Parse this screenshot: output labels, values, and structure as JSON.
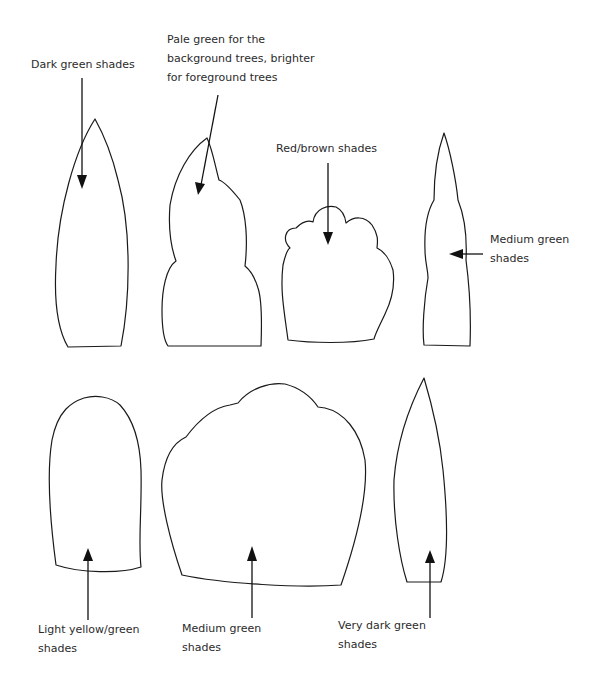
{
  "diagram": {
    "type": "tree-shape-color-guide",
    "labels": [
      {
        "id": "dark-green",
        "text": "Dark green shades"
      },
      {
        "id": "pale-green",
        "text": "Pale green for the\nbackground trees, brighter\nfor foreground trees"
      },
      {
        "id": "red-brown",
        "text": "Red/brown shades"
      },
      {
        "id": "medium-green-top",
        "text": "Medium green\nshades"
      },
      {
        "id": "light-yellow-green",
        "text": "Light yellow/green\nshades"
      },
      {
        "id": "medium-green-bottom",
        "text": "Medium green\nshades"
      },
      {
        "id": "very-dark-green",
        "text": "Very dark green\nshades"
      }
    ],
    "shapes": [
      {
        "id": "tall-pointed-tree",
        "row": 1,
        "color_label": "Dark green shades"
      },
      {
        "id": "stacked-bumpy-tree",
        "row": 1,
        "color_label": "Pale green for the background trees, brighter for foreground trees"
      },
      {
        "id": "cloud-top-tree",
        "row": 1,
        "color_label": "Red/brown shades"
      },
      {
        "id": "narrow-spire-tree",
        "row": 1,
        "color_label": "Medium green shades"
      },
      {
        "id": "rounded-dome-tree",
        "row": 2,
        "color_label": "Light yellow/green shades"
      },
      {
        "id": "wide-bushy-tree",
        "row": 2,
        "color_label": "Medium green shades"
      },
      {
        "id": "slim-flame-tree",
        "row": 2,
        "color_label": "Very dark green shades"
      }
    ]
  }
}
